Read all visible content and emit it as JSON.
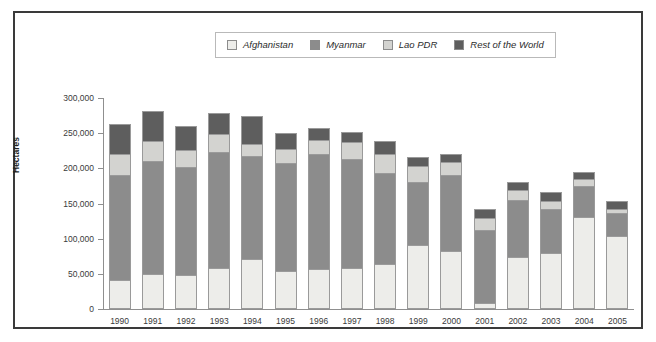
{
  "chart_data": {
    "type": "bar",
    "stacked": true,
    "title": "",
    "xlabel": "",
    "ylabel": "Hectares",
    "ylim": [
      0,
      300000
    ],
    "ytick_values": [
      0,
      50000,
      100000,
      150000,
      200000,
      250000,
      300000
    ],
    "ytick_labels": [
      "0",
      "50,000",
      "100,000",
      "150,000",
      "200,000",
      "250,000",
      "300,000"
    ],
    "grid": false,
    "legend_position": "top-center",
    "categories": [
      "1990",
      "1991",
      "1992",
      "1993",
      "1994",
      "1995",
      "1996",
      "1997",
      "1998",
      "1999",
      "2000",
      "2001",
      "2002",
      "2003",
      "2004",
      "2005"
    ],
    "series": [
      {
        "name": "Afghanistan",
        "color": "#ededea",
        "values": [
          41000,
          50000,
          49000,
          58000,
          71000,
          54000,
          57000,
          58000,
          64000,
          91000,
          82000,
          8000,
          74000,
          80000,
          131000,
          104000
        ]
      },
      {
        "name": "Myanmar",
        "color": "#8c8c8c",
        "values": [
          150000,
          160000,
          153000,
          165000,
          146000,
          154000,
          163000,
          155000,
          130000,
          89000,
          108000,
          105000,
          81000,
          62000,
          44000,
          32000
        ]
      },
      {
        "name": "Lao PDR",
        "color": "#d3d3d0",
        "values": [
          30000,
          29000,
          24000,
          26000,
          18000,
          19000,
          21000,
          25000,
          27000,
          23000,
          19000,
          17000,
          14000,
          12000,
          10000,
          6000
        ]
      },
      {
        "name": "Rest of the World",
        "color": "#5e5e5e",
        "values": [
          42000,
          43000,
          34000,
          29000,
          39000,
          23000,
          17000,
          14000,
          18000,
          13000,
          12000,
          12000,
          12000,
          13000,
          10000,
          11000
        ]
      }
    ],
    "totals": [
      263000,
      282000,
      260000,
      278000,
      274000,
      250000,
      258000,
      252000,
      239000,
      216000,
      221000,
      142000,
      181000,
      167000,
      195000,
      153000
    ]
  },
  "legend": {
    "items": [
      {
        "label": "Afghanistan",
        "color": "#ededea"
      },
      {
        "label": "Myanmar",
        "color": "#8c8c8c"
      },
      {
        "label": "Lao PDR",
        "color": "#d3d3d0"
      },
      {
        "label": "Rest of the World",
        "color": "#5e5e5e"
      }
    ]
  }
}
